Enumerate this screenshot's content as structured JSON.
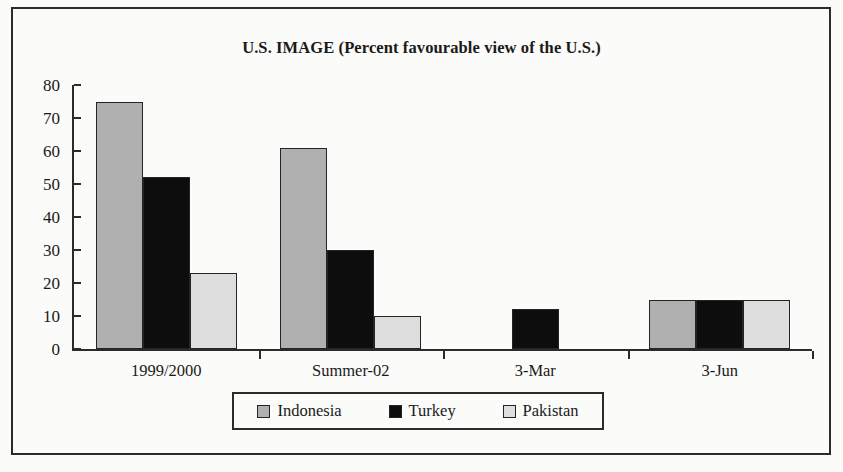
{
  "figure": {
    "background_color": "#fbfbf9",
    "frame_color": "#2b2b2b"
  },
  "chart_data": {
    "type": "bar",
    "title": "U.S. IMAGE (Percent favourable view of the U.S.)",
    "xlabel": "",
    "ylabel": "",
    "ylim": [
      0,
      80
    ],
    "yticks": [
      0,
      10,
      20,
      30,
      40,
      50,
      60,
      70,
      80
    ],
    "grid": false,
    "legend_position": "bottom-center",
    "categories": [
      "1999/2000",
      "Summer-02",
      "3-Mar",
      "3-Jun"
    ],
    "series": [
      {
        "name": "Indonesia",
        "color": "#b0b0b0",
        "values": [
          75,
          61,
          0,
          15
        ]
      },
      {
        "name": "Turkey",
        "color": "#0d0d0d",
        "values": [
          52,
          30,
          12,
          15
        ]
      },
      {
        "name": "Pakistan",
        "color": "#dedede",
        "values": [
          23,
          10,
          0,
          15
        ]
      }
    ]
  }
}
